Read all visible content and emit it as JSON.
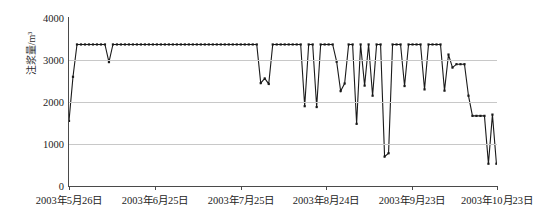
{
  "chart_data": {
    "type": "line",
    "title": "",
    "xlabel": "",
    "ylabel": "注浆量/m³",
    "ylim": [
      0,
      4000
    ],
    "yticks": [
      0,
      1000,
      2000,
      3000,
      4000
    ],
    "ytick_labels": [
      "0",
      "1000",
      "2000",
      "3000",
      "4000"
    ],
    "grid": true,
    "grid_axis": "y",
    "legend": "none",
    "marker": "cross-dot",
    "line_color": "#1a1a1a",
    "grid_color": "#c8c8c8",
    "axis_color": "#4a4a4a",
    "xticks": [
      0,
      30,
      60,
      90,
      120,
      150
    ],
    "xtick_labels": [
      "2003年5月26日",
      "2003年6月25日",
      "2003年7月25日",
      "2003年8月24日",
      "2003年9月23日",
      "2003年10月23日"
    ],
    "xlim": [
      0,
      150
    ],
    "x": [
      0,
      1.4,
      2.8,
      4.2,
      5.6,
      7.0,
      8.4,
      9.8,
      11.2,
      12.6,
      14.0,
      15.4,
      16.8,
      18.2,
      19.6,
      21.0,
      22.4,
      23.8,
      25.2,
      26.6,
      28.0,
      29.4,
      30.8,
      32.2,
      33.6,
      35.0,
      36.4,
      37.8,
      39.2,
      40.6,
      42.0,
      43.4,
      44.8,
      46.2,
      47.6,
      49.0,
      50.4,
      51.8,
      53.2,
      54.6,
      56.0,
      57.4,
      58.8,
      60.2,
      61.6,
      63.0,
      64.4,
      65.8,
      67.2,
      68.6,
      70.0,
      71.4,
      72.8,
      74.2,
      75.6,
      77.0,
      78.4,
      79.8,
      81.2,
      82.6,
      84.0,
      85.4,
      86.8,
      88.2,
      89.6,
      91.0,
      92.4,
      93.8,
      95.2,
      96.6,
      98.0,
      99.4,
      100.8,
      102.2,
      103.6,
      105.0,
      106.4,
      107.8,
      109.2,
      110.6,
      112.0,
      113.4,
      114.8,
      116.2,
      117.6,
      119.0,
      120.4,
      121.8,
      123.2,
      124.6,
      126.0,
      127.4,
      128.8,
      130.2,
      131.6,
      133.0,
      134.4,
      135.8,
      137.2,
      138.6,
      140.0,
      141.4,
      142.8,
      144.2,
      145.6,
      147.0,
      148.4,
      149.8
    ],
    "values": [
      1550,
      2600,
      3370,
      3370,
      3370,
      3370,
      3370,
      3370,
      3370,
      3370,
      2950,
      3370,
      3370,
      3370,
      3370,
      3370,
      3370,
      3370,
      3370,
      3370,
      3370,
      3370,
      3370,
      3370,
      3370,
      3370,
      3370,
      3370,
      3370,
      3370,
      3370,
      3370,
      3370,
      3370,
      3370,
      3370,
      3370,
      3370,
      3370,
      3370,
      3370,
      3370,
      3370,
      3370,
      3370,
      3370,
      3370,
      3370,
      2450,
      2560,
      2430,
      3370,
      3370,
      3370,
      3370,
      3370,
      3370,
      3370,
      3370,
      1900,
      3370,
      3370,
      1880,
      3370,
      3370,
      3370,
      3370,
      2960,
      2260,
      2440,
      3370,
      3370,
      1480,
      3370,
      2390,
      3370,
      2150,
      3370,
      3370,
      700,
      780,
      3370,
      3370,
      3370,
      2380,
      3370,
      3370,
      3370,
      3370,
      2300,
      3370,
      3370,
      3370,
      3370,
      2270,
      3130,
      2820,
      2900,
      2900,
      2900,
      2150,
      1670,
      1670,
      1670,
      1670,
      530,
      1700,
      530
    ],
    "series_name": "注浆量",
    "source_note": ""
  }
}
